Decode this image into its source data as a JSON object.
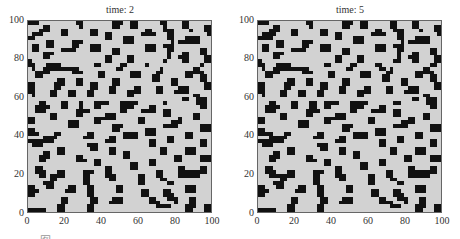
{
  "chart_data": [
    {
      "type": "heatmap",
      "title": "time: 2",
      "xlabel": "",
      "ylabel": "",
      "xlim": [
        0,
        100
      ],
      "ylim": [
        0,
        100
      ],
      "xticks": [
        "0",
        "20",
        "40",
        "60",
        "80",
        "100"
      ],
      "yticks": [
        "0",
        "20",
        "40",
        "60",
        "80",
        "100"
      ],
      "grid": false,
      "colormap": {
        "0": "#d2d2d2",
        "1": "#111111"
      },
      "description": "Binary 2D cellular pattern: black blobs on light gray background",
      "resolution": 50,
      "rows_top_to_bottom": [
        "11100000000001100000000111001100000011000011000000",
        "00001100000000100000000110001100000001000011000011",
        "00011100011000000110000000000000110001110000100011",
        "01110000011000000110011000000001111000110000000001",
        "11000000000000000000011000111000000000110001111000",
        "00000110000011100000000000111000000000010111111000",
        "01100110000011000111000000000000111001110000000000",
        "01100000011110000111000110000000111000110000000110",
        "00001110000000000000000110000000000000100011000110",
        "00001100000000000000011000011000000000100111000011",
        "10000000000000000000011000011000000001000011000011",
        "11000111100000000011000001100000100000000000000100",
        "01001111111111000000000011000000000010000000011000",
        "00111100000011100001100000001110000110000001111100",
        "00110000000000000001100000001110001100000001100110",
        "00000000110001100000000110000000001100011000000110",
        "11000001110001100110000110000000000000011000000011",
        "11000001100000000110001100000110000110000111000011",
        "11000011000110001100001100011110000110001111000000",
        "01000011000110001100000000011000000000000000011000",
        "00000000000000000000000000000000000000000011001110",
        "00011000011000100011110001111100000001000000001110",
        "00111100011000100011000001111000011000000000000110",
        "00111000000001111000000001100001111001100000000000",
        "00000011000001100000011100000000000001100000011000",
        "11000011000000000011111100000011000000000100011000",
        "11000000000111000011000000000011000000011100000000",
        "00000000000111000000000111000000000001111000000111",
        "11000000000000000000000110000000111000000000000111",
        "11100001100000001100000000111100111000000001100000",
        "00001111000000011100001100111100000000110001100000",
        "11111110000000000000011100000000011000110000000110",
        "01110000000000001110000000000000011000000000000110",
        "00000000110000000110001100000000000011000001110000",
        "00001100110000000000001100110000000011000001110000",
        "00011100000001100000000000110000000000001100000111",
        "00011000000001110011000000000000011000001100000111",
        "00000000000000000011000000001100011000000000000000",
        "00110000000000000000011000001100000000000110000110",
        "00111000110000011100011000000000000110000111111110",
        "00011011110000011000011100000011000110000111111000",
        "00000011000000011000001100000011000011000000000000",
        "00001110000000011000000000000011000000110000000000",
        "11000110000110001100000011000000000000000001110000",
        "11100000001110001100000011000001100001100001110000",
        "11000000000000001100000000000001100001110000000000",
        "00000000011000000110000111000000011000111000110000",
        "00000000011000000110001111000000011100001000110000",
        "00000000110000001100000000000000000111100001110011",
        "11111000110000001100000000000000000000000001100011"
      ]
    },
    {
      "type": "heatmap",
      "title": "time: 5",
      "xlabel": "",
      "ylabel": "",
      "xlim": [
        0,
        100
      ],
      "ylim": [
        0,
        100
      ],
      "xticks": [
        "0",
        "20",
        "40",
        "60",
        "80",
        "100"
      ],
      "yticks": [
        "0",
        "20",
        "40",
        "60",
        "80",
        "100"
      ],
      "grid": false,
      "colormap": {
        "0": "#d2d2d2",
        "1": "#111111"
      },
      "description": "Binary 2D cellular pattern at later time step: blobs slightly smoother and more rounded",
      "resolution": 50,
      "rows_top_to_bottom": [
        "11100000000001100000000111001100000011000011000000",
        "00001100000000100000000110001100000011000011000011",
        "00011100011000000110000000000000110001110000100011",
        "01111000011000000110011000000001111000110000000001",
        "11110000000000000000011000111000000000110001111000",
        "00000110000011100000000000111000000000010111111000",
        "01100110000011000111000000000000111001110000000000",
        "01100000011110000111000110000000111000110000000110",
        "00001110000000000000000110000000000000100011000110",
        "00001100000000000000011000011000000000100111000011",
        "10000000000000000000011000011000000001100011000011",
        "11000111100000000011000001100000110000000000000110",
        "01001111111111000000000011000000011010000000011000",
        "00111100000011100001100000001110000110000001111100",
        "00110000000000000001100000001110001100000001100110",
        "00000000110001100000000110000000001100011000000110",
        "11000001110001100110000110000000000000011000000011",
        "11000001100000000110001100000110000110000111000011",
        "11000011000110001100001100011110000110001111000000",
        "01000011000110001100000000011000000000000000011000",
        "00000000000000000000000000000000000000000011001110",
        "00011000011000110011110001111100000001100000001110",
        "00111100011000110011000001111000011000000000000110",
        "00111000000001111000000001100001111001100000000000",
        "00000011000001100000011100000000000001100000011000",
        "11000011000000000011111100000011000000000110011000",
        "11000000000111000011000000000011000000011110000000",
        "00000000000111000000000111000000000001111000000111",
        "11000000000000000000000110000000111000000000000111",
        "11110001100000001100000000111100111000000001100000",
        "00011111000000011100001100111100000000110001100000",
        "11111110000000000000011100000000011000110000000110",
        "01110000000000001110000000000000011000000000000110",
        "00000000110000000110001100000000000011000001110000",
        "00001100110000000000001100110000000011000001110000",
        "00011100000001100000000000110000000000001100000111",
        "00011000000001110011000000000000011000001100000111",
        "00000000000000000011000000001100011000000000000000",
        "00110000000000000000011000001100000000000110000110",
        "00111000110000011100011000000000000110000111111110",
        "00011111110000011000011100000011000110000111111000",
        "00000011000000011000001100000011000011000000000000",
        "00001110000000011000000000000011000000110000000000",
        "11000110000110001100000011000000000000000001110000",
        "11100000001110001100000011000001100001100001110000",
        "11000000000000001100000000000001100001110000000000",
        "00000000011000000110000111000000011000111000110000",
        "00000000011000000110001111000000011110001000110000",
        "00000000110000001100000000000000000011100001110011",
        "11111000110000001100000000000000000000000001100011"
      ]
    }
  ],
  "caption": "图 ——————————————"
}
